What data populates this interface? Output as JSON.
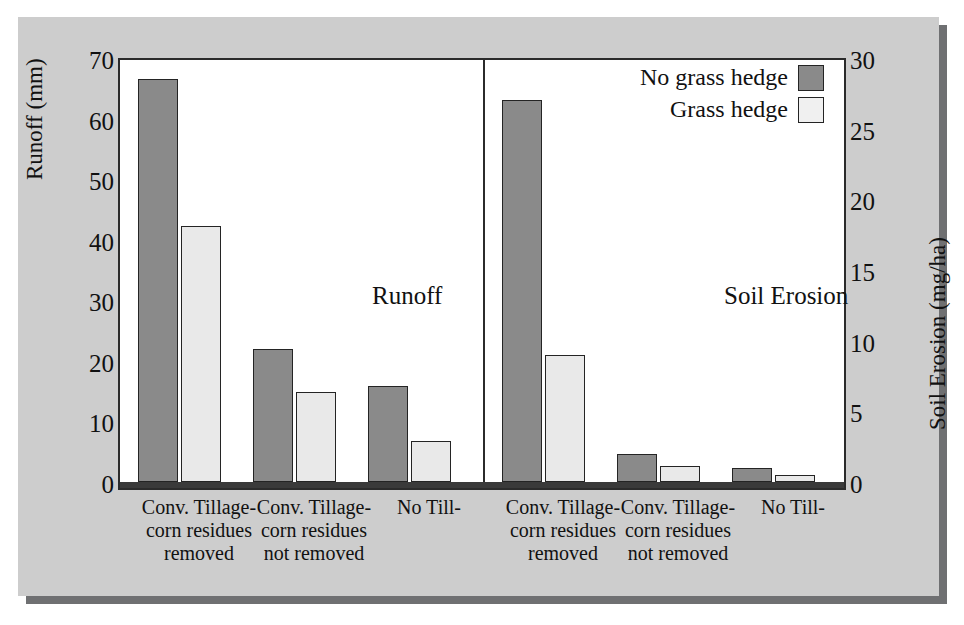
{
  "chart_data": {
    "type": "bar",
    "title": "",
    "panels": [
      {
        "name": "Runoff",
        "caption": "Runoff",
        "axis": "left",
        "ylabel": "Runoff (mm)",
        "ylim": [
          0,
          70
        ],
        "yticks": [
          0,
          10,
          20,
          30,
          40,
          50,
          60,
          70
        ],
        "categories": [
          "Conv. Tillage-corn residues removed",
          "Conv. Tillage-corn residues not removed",
          "No Till-"
        ],
        "series": [
          {
            "name": "No grass hedge",
            "values": [
              66.5,
              22.0,
              15.8
            ]
          },
          {
            "name": "Grass hedge",
            "values": [
              42.3,
              14.8,
              6.7
            ]
          }
        ]
      },
      {
        "name": "Soil Erosion",
        "caption": "Soil Erosion",
        "axis": "right",
        "ylabel": "Soil Erosion (mg/ha)",
        "ylim": [
          0,
          30
        ],
        "yticks": [
          0,
          5,
          10,
          15,
          20,
          25,
          30
        ],
        "categories": [
          "Conv. Tillage-corn residues removed",
          "Conv. Tillage-corn residues not removed",
          "No Till-"
        ],
        "series": [
          {
            "name": "No grass hedge",
            "values": [
              27.0,
              2.0,
              1.0
            ]
          },
          {
            "name": "Grass hedge",
            "values": [
              9.0,
              1.1,
              0.5
            ]
          }
        ]
      }
    ],
    "legend": {
      "position": "top-right",
      "entries": [
        {
          "label": "No grass hedge",
          "color": "#8a8a8a"
        },
        {
          "label": "Grass hedge",
          "color": "#f0f0f0"
        }
      ]
    },
    "grid": false,
    "colors": {
      "no_grass_hedge": "#8a8a8a",
      "grass_hedge": "#e9e9e9",
      "plot_background": "#ffffff",
      "figure_background": "#cdcdcd",
      "axis": "#2b2b2b"
    }
  },
  "axes": {
    "left": {
      "label": "Runoff (mm)",
      "ticks": [
        "70",
        "60",
        "50",
        "40",
        "30",
        "20",
        "10",
        "0"
      ]
    },
    "right": {
      "label": "Soil Erosion (mg/ha)",
      "ticks": [
        "30",
        "25",
        "20",
        "15",
        "10",
        "5",
        "0"
      ]
    }
  },
  "captions": {
    "runoff": "Runoff",
    "soil_erosion": "Soil Erosion"
  },
  "legend": {
    "rows": [
      {
        "label": "No grass hedge"
      },
      {
        "label": "Grass hedge"
      }
    ]
  },
  "x_labels": [
    {
      "line1": "Conv. Tillage-",
      "line2": "corn residues",
      "line3": "removed"
    },
    {
      "line1": "Conv. Tillage-",
      "line2": "corn residues",
      "line3": "not removed"
    },
    {
      "line1": "No Till-",
      "line2": "",
      "line3": ""
    },
    {
      "line1": "Conv. Tillage-",
      "line2": "corn residues",
      "line3": "removed"
    },
    {
      "line1": "Conv. Tillage-",
      "line2": "corn residues",
      "line3": "not removed"
    },
    {
      "line1": "No Till-",
      "line2": "",
      "line3": ""
    }
  ]
}
